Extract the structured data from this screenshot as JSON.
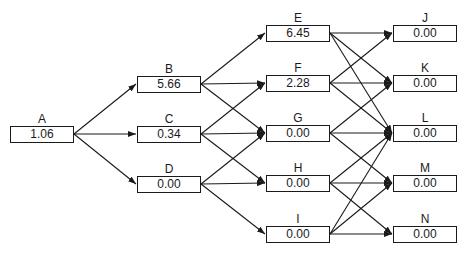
{
  "diagram": {
    "type": "layered-directed-graph",
    "box_width": 64,
    "box_height": 17,
    "colors": {
      "stroke": "#1a1a1a",
      "background": "#ffffff",
      "text": "#1a1a1a"
    },
    "nodes": [
      {
        "id": "A",
        "label": "A",
        "value": "1.06",
        "x": 10,
        "cy": 134
      },
      {
        "id": "B",
        "label": "B",
        "value": "5.66",
        "x": 137,
        "cy": 84
      },
      {
        "id": "C",
        "label": "C",
        "value": "0.34",
        "x": 137,
        "cy": 134
      },
      {
        "id": "D",
        "label": "D",
        "value": "0.00",
        "x": 137,
        "cy": 184
      },
      {
        "id": "E",
        "label": "E",
        "value": "6.45",
        "x": 266,
        "cy": 33
      },
      {
        "id": "F",
        "label": "F",
        "value": "2.28",
        "x": 266,
        "cy": 83
      },
      {
        "id": "G",
        "label": "G",
        "value": "0.00",
        "x": 266,
        "cy": 133
      },
      {
        "id": "H",
        "label": "H",
        "value": "0.00",
        "x": 266,
        "cy": 183
      },
      {
        "id": "I",
        "label": "I",
        "value": "0.00",
        "x": 266,
        "cy": 234
      },
      {
        "id": "J",
        "label": "J",
        "value": "0.00",
        "x": 393,
        "cy": 33
      },
      {
        "id": "K",
        "label": "K",
        "value": "0.00",
        "x": 393,
        "cy": 83
      },
      {
        "id": "L",
        "label": "L",
        "value": "0.00",
        "x": 393,
        "cy": 133
      },
      {
        "id": "M",
        "label": "M",
        "value": "0.00",
        "x": 393,
        "cy": 183
      },
      {
        "id": "N",
        "label": "N",
        "value": "0.00",
        "x": 393,
        "cy": 234
      }
    ],
    "edges": [
      [
        "A",
        "B"
      ],
      [
        "A",
        "C"
      ],
      [
        "A",
        "D"
      ],
      [
        "B",
        "E"
      ],
      [
        "B",
        "F"
      ],
      [
        "B",
        "G"
      ],
      [
        "C",
        "F"
      ],
      [
        "C",
        "G"
      ],
      [
        "C",
        "H"
      ],
      [
        "D",
        "G"
      ],
      [
        "D",
        "H"
      ],
      [
        "D",
        "I"
      ],
      [
        "E",
        "J"
      ],
      [
        "E",
        "K"
      ],
      [
        "E",
        "L"
      ],
      [
        "F",
        "J"
      ],
      [
        "F",
        "K"
      ],
      [
        "F",
        "L"
      ],
      [
        "G",
        "K"
      ],
      [
        "G",
        "L"
      ],
      [
        "G",
        "M"
      ],
      [
        "H",
        "L"
      ],
      [
        "H",
        "M"
      ],
      [
        "H",
        "N"
      ],
      [
        "I",
        "L"
      ],
      [
        "I",
        "M"
      ],
      [
        "I",
        "N"
      ]
    ]
  }
}
